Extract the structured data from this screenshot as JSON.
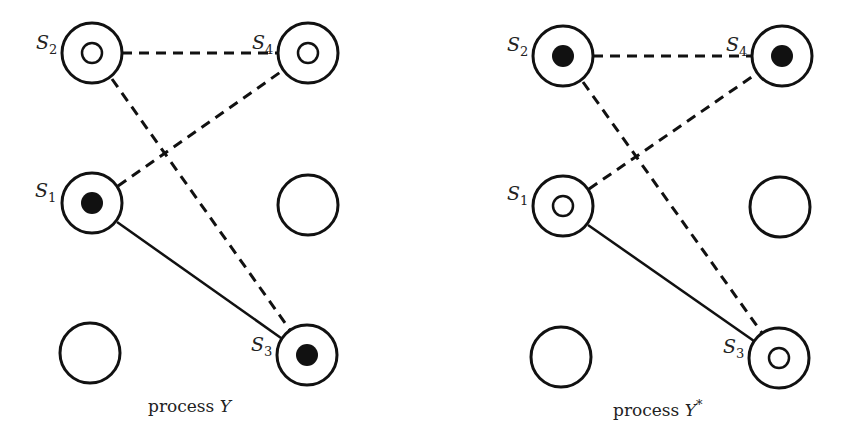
{
  "diagrams": [
    {
      "id": "left",
      "caption_prefix": "process",
      "caption_var": "Y",
      "caption_sup": "",
      "nodes": [
        {
          "label": "S",
          "sub": "2",
          "x": 92,
          "y": 53,
          "inner": "hollow"
        },
        {
          "label": "S",
          "sub": "4",
          "x": 308,
          "y": 53,
          "inner": "hollow"
        },
        {
          "label": "S",
          "sub": "1",
          "x": 92,
          "y": 203,
          "inner": "filled"
        },
        {
          "label": "",
          "sub": "",
          "x": 308,
          "y": 205,
          "inner": "none"
        },
        {
          "label": "",
          "sub": "",
          "x": 90,
          "y": 353,
          "inner": "none"
        },
        {
          "label": "S",
          "sub": "3",
          "x": 307,
          "y": 355,
          "inner": "filled"
        }
      ]
    },
    {
      "id": "right",
      "caption_prefix": "process",
      "caption_var": "Y",
      "caption_sup": "*",
      "nodes": [
        {
          "label": "S",
          "sub": "2",
          "x": 563,
          "y": 56,
          "inner": "filled"
        },
        {
          "label": "S",
          "sub": "4",
          "x": 782,
          "y": 56,
          "inner": "filled"
        },
        {
          "label": "S",
          "sub": "1",
          "x": 563,
          "y": 206,
          "inner": "hollow"
        },
        {
          "label": "",
          "sub": "",
          "x": 780,
          "y": 207,
          "inner": "none"
        },
        {
          "label": "",
          "sub": "",
          "x": 561,
          "y": 357,
          "inner": "none"
        },
        {
          "label": "S",
          "sub": "3",
          "x": 779,
          "y": 358,
          "inner": "hollow"
        }
      ]
    }
  ],
  "edges": [
    {
      "from": "S2",
      "to": "S4",
      "style": "dashed"
    },
    {
      "from": "S1",
      "to": "S4",
      "style": "dashed"
    },
    {
      "from": "S2",
      "to": "S3",
      "style": "dashed"
    },
    {
      "from": "S1",
      "to": "S3",
      "style": "solid"
    }
  ],
  "colors": {
    "stroke": "#111111",
    "background": "#ffffff"
  }
}
